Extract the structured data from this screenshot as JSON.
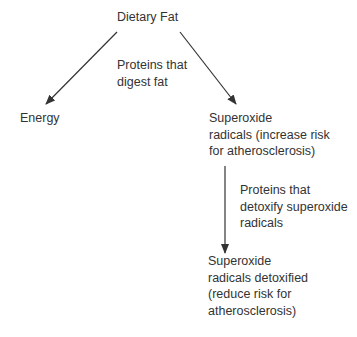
{
  "diagram": {
    "type": "flowchart",
    "nodes": {
      "root": {
        "label": "Dietary Fat"
      },
      "energy": {
        "label": "Energy"
      },
      "superoxide": {
        "lines": [
          "Superoxide",
          "radicals (increase risk",
          "for atherosclerosis)"
        ]
      },
      "detoxified": {
        "lines": [
          "Superoxide",
          "radicals detoxified",
          "(reduce risk for",
          "atherosclerosis)"
        ]
      }
    },
    "edge_labels": {
      "digest": {
        "lines": [
          "Proteins that",
          "digest fat"
        ]
      },
      "detoxify": {
        "lines": [
          "Proteins that",
          "detoxify superoxide",
          "radicals"
        ]
      }
    },
    "edges": [
      {
        "from": "root",
        "to": "energy"
      },
      {
        "from": "root",
        "to": "superoxide"
      },
      {
        "from": "superoxide",
        "to": "detoxified"
      }
    ],
    "colors": {
      "text": "#333333",
      "arrow": "#333333",
      "background": "#ffffff"
    }
  }
}
